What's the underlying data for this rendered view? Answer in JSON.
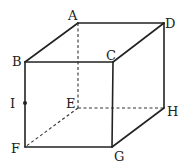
{
  "diagram": {
    "type": "cube",
    "colors": {
      "stroke": "#222222",
      "background": "#ffffff"
    },
    "vertices": {
      "A": {
        "label": "A",
        "x": 78,
        "y": 23
      },
      "B": {
        "label": "B",
        "x": 25,
        "y": 62
      },
      "C": {
        "label": "C",
        "x": 113,
        "y": 62
      },
      "D": {
        "label": "D",
        "x": 164,
        "y": 23
      },
      "E": {
        "label": "E",
        "x": 78,
        "y": 108
      },
      "F": {
        "label": "F",
        "x": 25,
        "y": 147
      },
      "G": {
        "label": "G",
        "x": 112,
        "y": 147
      },
      "H": {
        "label": "H",
        "x": 164,
        "y": 108
      },
      "I": {
        "label": "I",
        "x": 25,
        "y": 103
      }
    },
    "solid_edges": [
      "AB",
      "AD",
      "BC",
      "CD",
      "BF",
      "CG",
      "DH",
      "FG",
      "GH"
    ],
    "dashed_edges": [
      "AE",
      "EF",
      "EH"
    ],
    "points": [
      {
        "label": "I",
        "on_edge": "BF"
      }
    ]
  }
}
